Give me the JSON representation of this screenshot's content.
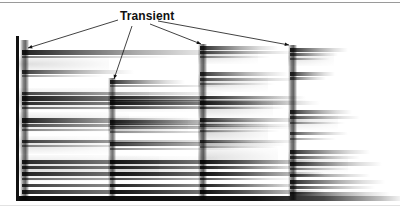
{
  "figure": {
    "type": "spectrogram",
    "background_color": "#ffffff",
    "ink_color": "#111111",
    "annotation_label": "Transient"
  },
  "axis": {
    "vertical_bar": {
      "x": 16,
      "y": 36,
      "width": 3,
      "height": 165
    },
    "xlabel": "",
    "ylabel": "",
    "tick_labels": []
  },
  "rules": {
    "top": {
      "y": 2,
      "color": "#9a9a9a"
    },
    "bottom": {
      "y": 205,
      "color": "#e2e2e2"
    }
  },
  "annotation": {
    "label": "Transient",
    "label_x": 120,
    "label_y": 9,
    "leaders": [
      {
        "name": "leader-to-note-1",
        "x1": 118,
        "y1": 20,
        "x2": 28,
        "y2": 48
      },
      {
        "name": "leader-to-note-2",
        "x1": 132,
        "y1": 26,
        "x2": 114,
        "y2": 79
      },
      {
        "name": "leader-to-note-3",
        "x1": 150,
        "y1": 24,
        "x2": 201,
        "y2": 44
      },
      {
        "name": "leader-to-note-4",
        "x1": 158,
        "y1": 21,
        "x2": 289,
        "y2": 45
      }
    ]
  },
  "chart_data": {
    "type": "heatmap",
    "title": "",
    "xlabel": "",
    "ylabel": "",
    "legend_position": "none",
    "grid": false,
    "plot_area": {
      "x": 19,
      "y": 36,
      "width": 381,
      "height": 167
    },
    "note_onsets_x": [
      22,
      110,
      200,
      290
    ],
    "notes": [
      {
        "name": "note-1",
        "onset_x": 22,
        "end_x": 400,
        "transient": {
          "x": 20,
          "y": 40,
          "width": 9,
          "height": 160,
          "strength": 0.85
        },
        "partials": [
          {
            "y": 50,
            "h": 5,
            "len": 222,
            "a": 0.95
          },
          {
            "y": 56,
            "h": 2,
            "len": 150,
            "a": 0.55
          },
          {
            "y": 70,
            "h": 4,
            "len": 112,
            "a": 0.82
          },
          {
            "y": 75,
            "h": 2,
            "len": 82,
            "a": 0.45
          },
          {
            "y": 92,
            "h": 3,
            "len": 205,
            "a": 0.78
          },
          {
            "y": 96,
            "h": 5,
            "len": 285,
            "a": 0.95
          },
          {
            "y": 102,
            "h": 3,
            "len": 265,
            "a": 0.88
          },
          {
            "y": 107,
            "h": 2,
            "len": 240,
            "a": 0.62
          },
          {
            "y": 118,
            "h": 5,
            "len": 180,
            "a": 0.92
          },
          {
            "y": 124,
            "h": 3,
            "len": 210,
            "a": 0.74
          },
          {
            "y": 129,
            "h": 2,
            "len": 160,
            "a": 0.52
          },
          {
            "y": 140,
            "h": 3,
            "len": 230,
            "a": 0.8
          },
          {
            "y": 145,
            "h": 2,
            "len": 150,
            "a": 0.5
          },
          {
            "y": 160,
            "h": 4,
            "len": 290,
            "a": 0.9
          },
          {
            "y": 166,
            "h": 3,
            "len": 275,
            "a": 0.85
          },
          {
            "y": 172,
            "h": 4,
            "len": 300,
            "a": 0.93
          },
          {
            "y": 178,
            "h": 2,
            "len": 240,
            "a": 0.66
          },
          {
            "y": 184,
            "h": 3,
            "len": 270,
            "a": 0.84
          },
          {
            "y": 190,
            "h": 4,
            "len": 300,
            "a": 0.92
          }
        ]
      },
      {
        "name": "note-2",
        "onset_x": 110,
        "end_x": 400,
        "transient": {
          "x": 108,
          "y": 78,
          "width": 8,
          "height": 122,
          "strength": 0.8
        },
        "partials": [
          {
            "y": 80,
            "h": 4,
            "len": 75,
            "a": 0.88
          },
          {
            "y": 85,
            "h": 2,
            "len": 120,
            "a": 0.48
          },
          {
            "y": 96,
            "h": 3,
            "len": 185,
            "a": 0.72
          },
          {
            "y": 100,
            "h": 5,
            "len": 200,
            "a": 0.92
          },
          {
            "y": 106,
            "h": 3,
            "len": 175,
            "a": 0.7
          },
          {
            "y": 120,
            "h": 5,
            "len": 160,
            "a": 0.9
          },
          {
            "y": 126,
            "h": 3,
            "len": 185,
            "a": 0.72
          },
          {
            "y": 131,
            "h": 2,
            "len": 140,
            "a": 0.5
          },
          {
            "y": 142,
            "h": 4,
            "len": 175,
            "a": 0.86
          },
          {
            "y": 148,
            "h": 2,
            "len": 130,
            "a": 0.52
          },
          {
            "y": 160,
            "h": 4,
            "len": 205,
            "a": 0.9
          },
          {
            "y": 166,
            "h": 3,
            "len": 190,
            "a": 0.82
          },
          {
            "y": 172,
            "h": 4,
            "len": 215,
            "a": 0.92
          },
          {
            "y": 178,
            "h": 2,
            "len": 160,
            "a": 0.64
          },
          {
            "y": 184,
            "h": 3,
            "len": 190,
            "a": 0.84
          },
          {
            "y": 190,
            "h": 4,
            "len": 215,
            "a": 0.92
          }
        ]
      },
      {
        "name": "note-3",
        "onset_x": 200,
        "end_x": 400,
        "transient": {
          "x": 198,
          "y": 44,
          "width": 9,
          "height": 156,
          "strength": 0.88
        },
        "partials": [
          {
            "y": 46,
            "h": 4,
            "len": 78,
            "a": 0.92
          },
          {
            "y": 51,
            "h": 3,
            "len": 95,
            "a": 0.8
          },
          {
            "y": 56,
            "h": 2,
            "len": 70,
            "a": 0.55
          },
          {
            "y": 72,
            "h": 4,
            "len": 88,
            "a": 0.86
          },
          {
            "y": 78,
            "h": 3,
            "len": 100,
            "a": 0.74
          },
          {
            "y": 83,
            "h": 2,
            "len": 75,
            "a": 0.5
          },
          {
            "y": 96,
            "h": 3,
            "len": 105,
            "a": 0.8
          },
          {
            "y": 101,
            "h": 4,
            "len": 120,
            "a": 0.9
          },
          {
            "y": 107,
            "h": 2,
            "len": 85,
            "a": 0.58
          },
          {
            "y": 118,
            "h": 4,
            "len": 110,
            "a": 0.88
          },
          {
            "y": 124,
            "h": 3,
            "len": 95,
            "a": 0.7
          },
          {
            "y": 130,
            "h": 2,
            "len": 80,
            "a": 0.52
          },
          {
            "y": 140,
            "h": 3,
            "len": 100,
            "a": 0.78
          },
          {
            "y": 146,
            "h": 2,
            "len": 78,
            "a": 0.5
          },
          {
            "y": 160,
            "h": 4,
            "len": 120,
            "a": 0.9
          },
          {
            "y": 166,
            "h": 3,
            "len": 110,
            "a": 0.84
          },
          {
            "y": 172,
            "h": 4,
            "len": 125,
            "a": 0.92
          },
          {
            "y": 178,
            "h": 2,
            "len": 95,
            "a": 0.64
          },
          {
            "y": 184,
            "h": 3,
            "len": 112,
            "a": 0.85
          },
          {
            "y": 190,
            "h": 4,
            "len": 125,
            "a": 0.92
          }
        ]
      },
      {
        "name": "note-4",
        "onset_x": 290,
        "end_x": 400,
        "transient": {
          "x": 288,
          "y": 45,
          "width": 9,
          "height": 155,
          "strength": 0.88
        },
        "partials": [
          {
            "y": 48,
            "h": 4,
            "len": 58,
            "a": 0.92
          },
          {
            "y": 53,
            "h": 3,
            "len": 48,
            "a": 0.8
          },
          {
            "y": 58,
            "h": 2,
            "len": 40,
            "a": 0.55
          },
          {
            "y": 72,
            "h": 4,
            "len": 45,
            "a": 0.88
          },
          {
            "y": 77,
            "h": 3,
            "len": 36,
            "a": 0.7
          },
          {
            "y": 110,
            "h": 4,
            "len": 62,
            "a": 0.88
          },
          {
            "y": 116,
            "h": 3,
            "len": 70,
            "a": 0.76
          },
          {
            "y": 122,
            "h": 2,
            "len": 55,
            "a": 0.54
          },
          {
            "y": 132,
            "h": 3,
            "len": 58,
            "a": 0.74
          },
          {
            "y": 138,
            "h": 2,
            "len": 46,
            "a": 0.5
          },
          {
            "y": 150,
            "h": 4,
            "len": 80,
            "a": 0.9
          },
          {
            "y": 156,
            "h": 3,
            "len": 70,
            "a": 0.8
          },
          {
            "y": 162,
            "h": 4,
            "len": 92,
            "a": 0.92
          },
          {
            "y": 168,
            "h": 2,
            "len": 62,
            "a": 0.62
          },
          {
            "y": 174,
            "h": 3,
            "len": 80,
            "a": 0.85
          },
          {
            "y": 180,
            "h": 4,
            "len": 95,
            "a": 0.92
          },
          {
            "y": 186,
            "h": 3,
            "len": 85,
            "a": 0.86
          },
          {
            "y": 192,
            "h": 4,
            "len": 100,
            "a": 0.92
          }
        ]
      }
    ],
    "smears": [
      {
        "x": 0,
        "y": 56,
        "w": 90,
        "h": 16,
        "a": 0.3
      },
      {
        "x": 0,
        "y": 88,
        "w": 130,
        "h": 22,
        "a": 0.36
      },
      {
        "x": 0,
        "y": 112,
        "w": 110,
        "h": 20,
        "a": 0.32
      },
      {
        "x": 0,
        "y": 136,
        "w": 95,
        "h": 18,
        "a": 0.28
      },
      {
        "x": 0,
        "y": 155,
        "w": 140,
        "h": 26,
        "a": 0.34
      },
      {
        "x": 89,
        "y": 92,
        "w": 90,
        "h": 20,
        "a": 0.3
      },
      {
        "x": 89,
        "y": 116,
        "w": 80,
        "h": 18,
        "a": 0.28
      },
      {
        "x": 89,
        "y": 156,
        "w": 110,
        "h": 24,
        "a": 0.32
      },
      {
        "x": 179,
        "y": 48,
        "w": 60,
        "h": 16,
        "a": 0.26
      },
      {
        "x": 179,
        "y": 74,
        "w": 70,
        "h": 18,
        "a": 0.3
      },
      {
        "x": 179,
        "y": 98,
        "w": 75,
        "h": 20,
        "a": 0.32
      },
      {
        "x": 179,
        "y": 122,
        "w": 70,
        "h": 22,
        "a": 0.34
      },
      {
        "x": 179,
        "y": 146,
        "w": 80,
        "h": 24,
        "a": 0.3
      },
      {
        "x": 269,
        "y": 50,
        "w": 46,
        "h": 16,
        "a": 0.26
      },
      {
        "x": 269,
        "y": 112,
        "w": 50,
        "h": 18,
        "a": 0.26
      },
      {
        "x": 269,
        "y": 152,
        "w": 60,
        "h": 22,
        "a": 0.28
      }
    ],
    "baseline": {
      "y": 160,
      "height": 5
    }
  }
}
